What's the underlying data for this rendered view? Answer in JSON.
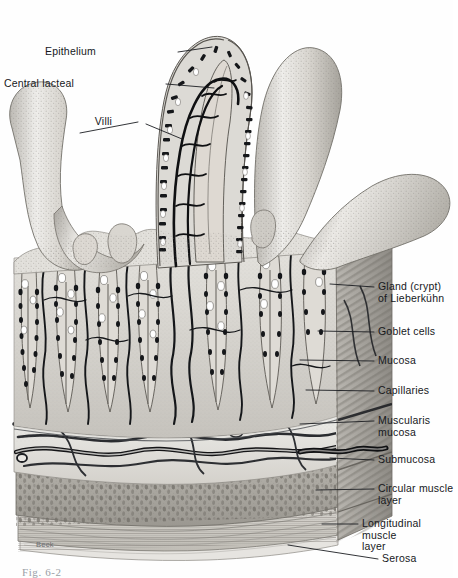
{
  "figure": {
    "kind": "anatomical-illustration",
    "artist_signature": "Beck",
    "caption": "Fig. 6-2",
    "palette": {
      "background": "#fefefe",
      "ink": "#16181c",
      "leader_line": "#1b1d21",
      "tissue_light": "#ecebe8",
      "tissue_mid": "#c9c7c2",
      "tissue_dark": "#8b8882",
      "vessel_dark": "#141416",
      "muscle_circular": "#a5a29b",
      "muscle_longitudinal": "#cfccc6",
      "goblet_white": "#ffffff"
    }
  },
  "labels_left": [
    {
      "id": "epithelium",
      "text": "Epithelium",
      "x": 96,
      "y": 46,
      "line": {
        "x1": 178,
        "y1": 52,
        "x2": 212,
        "y2": 47
      }
    },
    {
      "id": "central-lacteal",
      "text": "Central lacteal",
      "x": 74,
      "y": 78,
      "line": {
        "x1": 166,
        "y1": 84,
        "x2": 214,
        "y2": 88
      }
    },
    {
      "id": "villi",
      "text": "Villi",
      "x": 112,
      "y": 116,
      "line": {
        "x1": 138,
        "y1": 122,
        "x2": 80,
        "y2": 133
      },
      "line2": {
        "x1": 146,
        "y1": 124,
        "x2": 182,
        "y2": 139
      }
    }
  ],
  "labels_right": [
    {
      "id": "gland-crypt-lieberkuhn",
      "text": "Gland (crypt)\nof Lieberkühn",
      "x": 378,
      "y": 281,
      "two": true,
      "line": {
        "x1": 374,
        "y1": 287,
        "x2": 330,
        "y2": 284
      }
    },
    {
      "id": "goblet-cells",
      "text": "Goblet cells",
      "x": 378,
      "y": 326,
      "line": {
        "x1": 374,
        "y1": 332,
        "x2": 318,
        "y2": 331
      }
    },
    {
      "id": "mucosa",
      "text": "Mucosa",
      "x": 378,
      "y": 355,
      "line": {
        "x1": 374,
        "y1": 361,
        "x2": 300,
        "y2": 360
      }
    },
    {
      "id": "capillaries",
      "text": "Capillaries",
      "x": 378,
      "y": 385,
      "line": {
        "x1": 374,
        "y1": 391,
        "x2": 306,
        "y2": 390
      }
    },
    {
      "id": "muscularis-mucosa",
      "text": "Muscularis\nmucosa",
      "x": 378,
      "y": 415,
      "two": true,
      "line": {
        "x1": 374,
        "y1": 421,
        "x2": 300,
        "y2": 424
      }
    },
    {
      "id": "submucosa",
      "text": "Submucosa",
      "x": 378,
      "y": 454,
      "line": {
        "x1": 374,
        "y1": 460,
        "x2": 330,
        "y2": 458
      }
    },
    {
      "id": "circular-muscle-layer",
      "text": "Circular  muscle\nlayer",
      "x": 378,
      "y": 483,
      "two": true,
      "line": {
        "x1": 374,
        "y1": 489,
        "x2": 316,
        "y2": 490
      }
    },
    {
      "id": "longitudinal-muscle-layer",
      "text": "Longitudinal  muscle\nlayer",
      "x": 362,
      "y": 518,
      "two": true,
      "line": {
        "x1": 358,
        "y1": 524,
        "x2": 322,
        "y2": 524
      }
    },
    {
      "id": "serosa",
      "text": "Serosa",
      "x": 382,
      "y": 553,
      "line": {
        "x1": 378,
        "y1": 559,
        "x2": 288,
        "y2": 545
      }
    }
  ]
}
